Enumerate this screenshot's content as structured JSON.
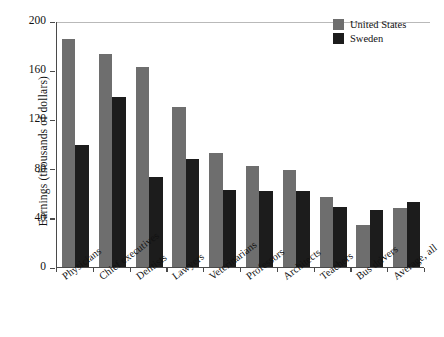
{
  "chart_data": {
    "type": "bar",
    "title": "",
    "xlabel": "",
    "ylabel": "Earnings (thousands of dollars)",
    "ylim": [
      0,
      200
    ],
    "yticks": [
      0,
      40,
      80,
      120,
      160,
      200
    ],
    "ytick_labels": [
      "0",
      "40",
      "80",
      "120",
      "160",
      "200"
    ],
    "grid": false,
    "legend_position": "top-right",
    "categories": [
      "Physicians",
      "Chief executives",
      "Dentists",
      "Lawyers",
      "Veterinarians",
      "Professors",
      "Architects",
      "Teachers",
      "Bus drivers",
      "Average, all"
    ],
    "series": [
      {
        "name": "United States",
        "color": "#6e6e6e",
        "values": [
          185,
          173,
          163,
          130,
          93,
          82,
          79,
          57,
          34,
          48
        ]
      },
      {
        "name": "Sweden",
        "color": "#1c1c1c",
        "values": [
          99,
          138,
          73,
          88,
          63,
          62,
          62,
          49,
          46,
          53
        ]
      }
    ]
  },
  "legend": {
    "items": [
      {
        "label": "United States",
        "color": "#6e6e6e"
      },
      {
        "label": "Sweden",
        "color": "#1c1c1c"
      }
    ]
  }
}
